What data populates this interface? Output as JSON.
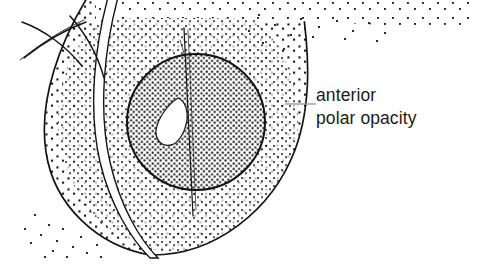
{
  "figure": {
    "background_color": "#ffffff",
    "ink_color": "#111111",
    "stipple_color": "#1a1a1a",
    "leader_color": "#9a9a9a",
    "structures": [
      {
        "name": "lens-body",
        "description": "large stippled lens cross-section"
      },
      {
        "name": "lens-nucleus",
        "description": "dense stippled central circle"
      },
      {
        "name": "polar-opacity-void",
        "description": "white leaf-shaped opacity at anterior pole"
      },
      {
        "name": "cornea-arcs",
        "description": "thin curved corneal layers upper left"
      },
      {
        "name": "iris-sliver",
        "description": "white curved gap crossing the lens"
      },
      {
        "name": "axis-line",
        "description": "thin vertical optical axis line"
      }
    ]
  },
  "annotation": {
    "line1": "anterior",
    "line2": "polar opacity",
    "leader": {
      "x1": 285,
      "y1": 104,
      "x2": 316,
      "y2": 104
    },
    "text_x": 316,
    "text_y1": 101,
    "text_y2": 124,
    "font_size": 17.5
  }
}
